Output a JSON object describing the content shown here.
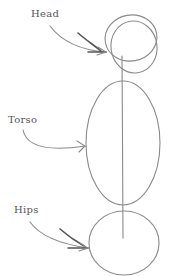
{
  "diagram": {
    "labels": {
      "head": "Head",
      "torso": "Torso",
      "hips": "Hips"
    },
    "colors": {
      "line": "#8a8a8a",
      "arrow_shadow": "#555555",
      "text": "#555555",
      "background": "#ffffff"
    }
  }
}
